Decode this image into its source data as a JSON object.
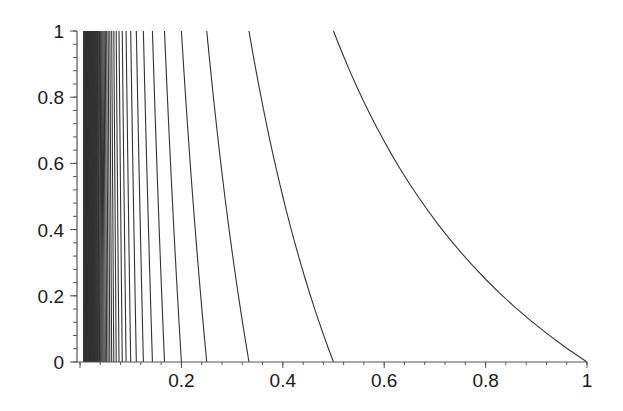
{
  "chart_data": {
    "type": "line",
    "title": "",
    "xlabel": "",
    "ylabel": "",
    "xlim": [
      0,
      1
    ],
    "ylim": [
      0,
      1
    ],
    "grid": false,
    "legend": null,
    "x_ticks": [
      {
        "value": 0,
        "label": "0"
      },
      {
        "value": 0.2,
        "label": "0.2"
      },
      {
        "value": 0.4,
        "label": "0.4"
      },
      {
        "value": 0.6,
        "label": "0.6"
      },
      {
        "value": 0.8,
        "label": "0.8"
      },
      {
        "value": 1,
        "label": "1"
      }
    ],
    "y_ticks": [
      {
        "value": 0,
        "label": "0"
      },
      {
        "value": 0.2,
        "label": "0.2"
      },
      {
        "value": 0.4,
        "label": "0.4"
      },
      {
        "value": 0.6,
        "label": "0.6"
      },
      {
        "value": 0.8,
        "label": "0.8"
      },
      {
        "value": 1,
        "label": "1"
      }
    ],
    "x_minor_step": 0.04,
    "y_minor_step": 0.04,
    "curves": {
      "formula": "x = 1/(n + y)",
      "n_min": 1,
      "n_max": 120,
      "samples": [
        {
          "n": 1,
          "points": [
            [
              1.0,
              0
            ],
            [
              0.909,
              0.1
            ],
            [
              0.833,
              0.2
            ],
            [
              0.769,
              0.3
            ],
            [
              0.714,
              0.4
            ],
            [
              0.667,
              0.5
            ],
            [
              0.625,
              0.6
            ],
            [
              0.588,
              0.7
            ],
            [
              0.556,
              0.8
            ],
            [
              0.526,
              0.9
            ],
            [
              0.5,
              1.0
            ]
          ]
        },
        {
          "n": 2,
          "points": [
            [
              0.5,
              0
            ],
            [
              0.4,
              0.5
            ],
            [
              0.333,
              1.0
            ]
          ]
        },
        {
          "n": 3,
          "points": [
            [
              0.333,
              0
            ],
            [
              0.286,
              0.5
            ],
            [
              0.25,
              1.0
            ]
          ]
        },
        {
          "n": 4,
          "points": [
            [
              0.25,
              0
            ],
            [
              0.222,
              0.5
            ],
            [
              0.2,
              1.0
            ]
          ]
        },
        {
          "n": 5,
          "points": [
            [
              0.2,
              0
            ],
            [
              0.182,
              0.5
            ],
            [
              0.167,
              1.0
            ]
          ]
        }
      ]
    },
    "line_color": "#333333",
    "axis_color": "#555555"
  }
}
